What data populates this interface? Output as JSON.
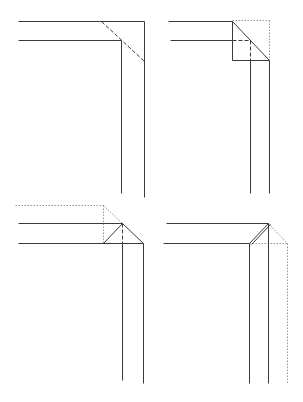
{
  "diagram": {
    "background": "#ffffff",
    "line_color": "#3a3a3a",
    "guide_color": "#8a8a8a",
    "panels": [
      {
        "id": "step-1",
        "position": "top-left",
        "solid_lines": [
          [
            18,
            21,
            144,
            21
          ],
          [
            18,
            40,
            121,
            40
          ],
          [
            121,
            40,
            121,
            193
          ],
          [
            144,
            21,
            144,
            197
          ]
        ],
        "dashed_lines": [
          [
            101,
            21,
            144,
            61
          ]
        ],
        "dotted_lines": []
      },
      {
        "id": "step-2",
        "position": "top-right",
        "solid_lines": [
          [
            168,
            21,
            232,
            21
          ],
          [
            170,
            40,
            232,
            40
          ],
          [
            232,
            21,
            232,
            60
          ],
          [
            232,
            60,
            269,
            60
          ],
          [
            232,
            21,
            269,
            60
          ],
          [
            250,
            60,
            250,
            193
          ],
          [
            269,
            60,
            269,
            193
          ]
        ],
        "dashed_lines": [
          [
            232,
            40,
            250,
            40
          ],
          [
            250,
            40,
            250,
            60
          ]
        ],
        "dotted_lines": [
          [
            232,
            20,
            269,
            20
          ],
          [
            269,
            20,
            269,
            60
          ]
        ]
      },
      {
        "id": "step-3",
        "position": "bottom-left",
        "solid_lines": [
          [
            18,
            223,
            122,
            223
          ],
          [
            18,
            243,
            143,
            243
          ],
          [
            103,
            243,
            122,
            223
          ],
          [
            122,
            223,
            143,
            243
          ],
          [
            122,
            243,
            122,
            380
          ],
          [
            143,
            243,
            143,
            383
          ]
        ],
        "dashed_lines": [
          [
            122,
            223,
            122,
            243
          ]
        ],
        "dotted_lines": [
          [
            15,
            205,
            103,
            205
          ],
          [
            103,
            205,
            103,
            243
          ],
          [
            103,
            205,
            122,
            223
          ]
        ]
      },
      {
        "id": "step-4",
        "position": "bottom-right",
        "solid_lines": [
          [
            166,
            223,
            268,
            223
          ],
          [
            163,
            243,
            249,
            243
          ],
          [
            249,
            243,
            268,
            223
          ],
          [
            251,
            244,
            270,
            224
          ],
          [
            249,
            243,
            249,
            383
          ],
          [
            268,
            223,
            268,
            383
          ]
        ],
        "dashed_lines": [],
        "dotted_lines": [
          [
            268,
            223,
            287,
            243
          ],
          [
            249,
            243,
            287,
            243
          ],
          [
            287,
            243,
            287,
            383
          ]
        ]
      }
    ]
  }
}
